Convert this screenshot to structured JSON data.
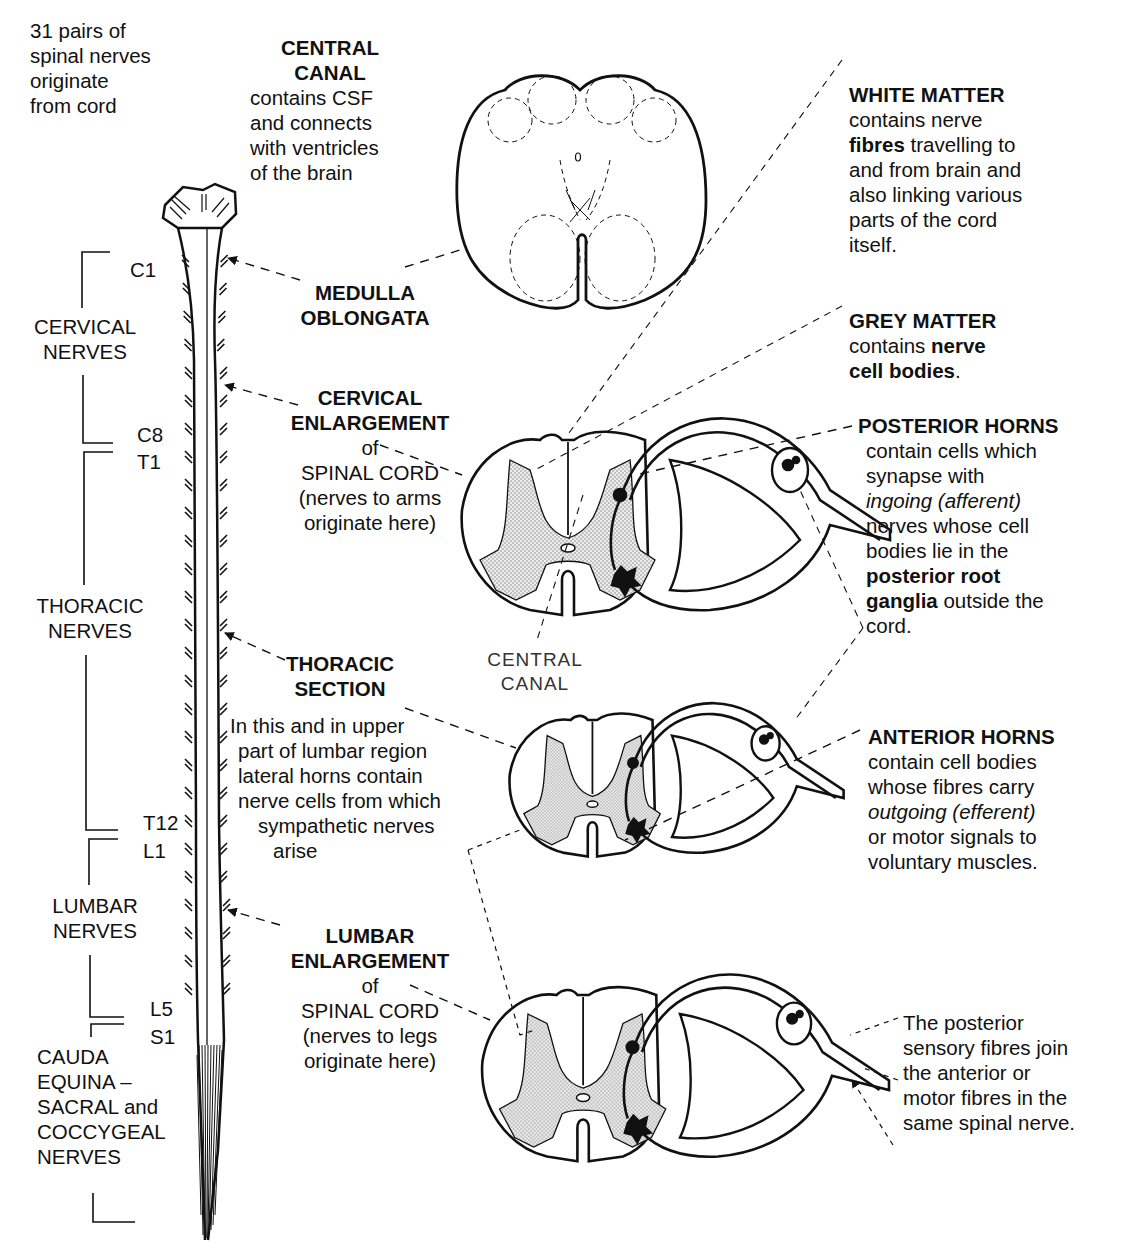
{
  "intro": {
    "lines": [
      "31 pairs of",
      "spinal nerves",
      "originate",
      "from cord"
    ]
  },
  "central_canal_top": {
    "title": [
      "CENTRAL",
      "CANAL"
    ],
    "body": [
      "contains CSF",
      "and connects",
      "with ventricles",
      "of the brain"
    ]
  },
  "white_matter": {
    "title": "WHITE MATTER",
    "line1": "contains nerve",
    "line2_bold": "fibres",
    "line2_rest": " travelling to",
    "line3": "and from brain and",
    "line4": "also linking various",
    "line5": "parts of the cord",
    "line6": "itself."
  },
  "grey_matter": {
    "title": "GREY MATTER",
    "line1_plain": "contains ",
    "line1_bold": "nerve",
    "line2_bold": "cell bodies",
    "line2_rest": "."
  },
  "posterior_horns": {
    "title": "POSTERIOR HORNS",
    "line1": "contain cells which",
    "line2": "synapse with",
    "line3_italic": "ingoing (afferent)",
    "line4": "nerves whose cell",
    "line5": "bodies lie in the",
    "line6_bold": "posterior root",
    "line7_bold": "ganglia",
    "line7_rest": " outside the",
    "line8": "cord."
  },
  "anterior_horns": {
    "title": "ANTERIOR HORNS",
    "line1": "contain cell bodies",
    "line2": "whose fibres carry",
    "line3_italic": "outgoing (efferent)",
    "line4": "or motor signals to",
    "line5": "voluntary muscles."
  },
  "join_note": {
    "lines": [
      "The posterior",
      "sensory fibres join",
      "the anterior or",
      "motor fibres in the",
      "same spinal nerve."
    ]
  },
  "medulla": {
    "title": [
      "MEDULLA",
      "OBLONGATA"
    ]
  },
  "cervical_enlargement": {
    "title": [
      "CERVICAL",
      "ENLARGEMENT"
    ],
    "body": [
      "of",
      "SPINAL CORD",
      "(nerves to arms",
      "originate here)"
    ]
  },
  "central_canal_label": {
    "lines": [
      "CENTRAL",
      "CANAL"
    ]
  },
  "thoracic_section": {
    "title": [
      "THORACIC",
      "SECTION"
    ],
    "body": [
      "In this and in upper",
      "part of lumbar region",
      "lateral horns contain",
      "nerve cells from which",
      "sympathetic nerves",
      "arise"
    ]
  },
  "lumbar_enlargement": {
    "title": [
      "LUMBAR",
      "ENLARGEMENT"
    ],
    "body": [
      "of",
      "SPINAL CORD",
      "(nerves to legs",
      "originate here)"
    ]
  },
  "nerve_groups": {
    "cervical": [
      "CERVICAL",
      "NERVES"
    ],
    "thoracic": [
      "THORACIC",
      "NERVES"
    ],
    "lumbar": [
      "LUMBAR",
      "NERVES"
    ],
    "cauda": [
      "CAUDA",
      "EQUINA –",
      "SACRAL and",
      "COCCYGEAL",
      "NERVES"
    ]
  },
  "segments": {
    "c1": "C1",
    "c8": "C8",
    "t1": "T1",
    "t12": "T12",
    "l1": "L1",
    "l5": "L5",
    "s1": "S1"
  },
  "colors": {
    "ink": "#111111",
    "grey_matter_fill": "#d6d6d6",
    "background": "#ffffff"
  }
}
